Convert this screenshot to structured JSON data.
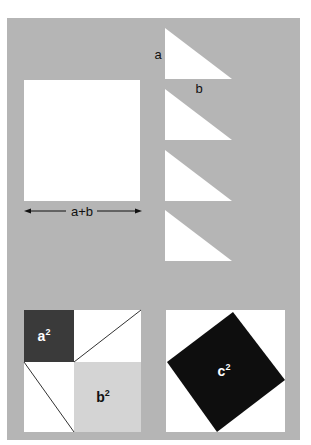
{
  "figure": {
    "colors": {
      "background": "#ffffff",
      "panel": "#b5b5b5",
      "shape_fill": "#ffffff",
      "a_squared_fill": "#3a3a3a",
      "b_squared_fill": "#d4d4d4",
      "c_squared_fill": "#0e0e0e",
      "text_dark": "#111111",
      "text_light": "#ffffff"
    },
    "big_square": {
      "dimension_label": "a+b"
    },
    "triangles": {
      "count": 4,
      "side_label_vertical": "a",
      "side_label_horizontal": "b"
    },
    "arrangement_left": {
      "square_a_label": "a",
      "square_a_exponent": "2",
      "square_b_label": "b",
      "square_b_exponent": "2"
    },
    "arrangement_right": {
      "square_c_label": "c",
      "square_c_exponent": "2"
    }
  }
}
